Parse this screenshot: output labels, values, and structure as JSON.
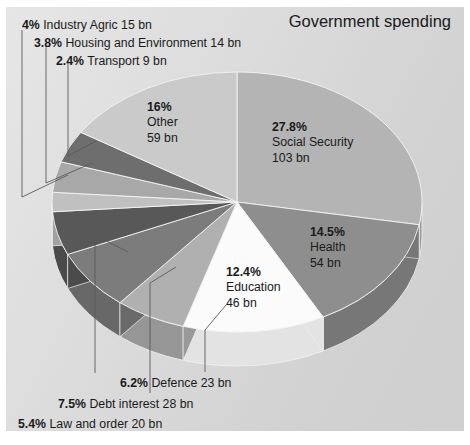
{
  "title": "Government spending",
  "chart_data": {
    "type": "pie",
    "title": "Government spending",
    "units": "bn",
    "legend": "none",
    "three_d": true,
    "slices": [
      {
        "name": "Social Security",
        "percent": 27.8,
        "value": 103,
        "percent_label": "27.8%",
        "value_label": "103 bn",
        "color": "#b4b4b4",
        "side_color": "#9a9a9a",
        "label_placement": "inside"
      },
      {
        "name": "Health",
        "percent": 14.5,
        "value": 54,
        "percent_label": "14.5%",
        "value_label": "54 bn",
        "color": "#8e8e8e",
        "side_color": "#777777",
        "label_placement": "inside"
      },
      {
        "name": "Education",
        "percent": 12.4,
        "value": 46,
        "percent_label": "12.4%",
        "value_label": "46 bn",
        "color": "#fbfbfb",
        "side_color": "#e3e3e3",
        "label_placement": "inside"
      },
      {
        "name": "Defence",
        "percent": 6.2,
        "value": 23,
        "percent_label": "6.2%",
        "value_label": "23 bn",
        "color": "#b0b0b0",
        "side_color": "#969696",
        "label_placement": "callout-bottom"
      },
      {
        "name": "Debt interest",
        "percent": 7.5,
        "value": 28,
        "percent_label": "7.5%",
        "value_label": "28 bn",
        "color": "#7c7c7c",
        "side_color": "#686868",
        "label_placement": "callout-bottom"
      },
      {
        "name": "Law and order",
        "percent": 5.4,
        "value": 20,
        "percent_label": "5.4%",
        "value_label": "20 bn",
        "color": "#585858",
        "side_color": "#4a4a4a",
        "label_placement": "callout-bottom"
      },
      {
        "name": "Transport",
        "percent": 2.4,
        "value": 9,
        "percent_label": "2.4%",
        "value_label": "9 bn",
        "color": "#c0c0c0",
        "side_color": "#a6a6a6",
        "label_placement": "callout-top"
      },
      {
        "name": "Housing and Environment",
        "percent": 3.8,
        "value": 14,
        "percent_label": "3.8%",
        "value_label": "14 bn",
        "color": "#a8a8a8",
        "side_color": "#8e8e8e",
        "label_placement": "callout-top"
      },
      {
        "name": "Industry Agric",
        "percent": 4.0,
        "value": 15,
        "percent_label": "4%",
        "value_label": "15 bn",
        "color": "#6e6e6e",
        "side_color": "#5c5c5c",
        "label_placement": "callout-top"
      },
      {
        "name": "Other",
        "percent": 16.0,
        "value": 59,
        "percent_label": "16%",
        "value_label": "59 bn",
        "color": "#cacaca",
        "side_color": "#b0b0b0",
        "label_placement": "inside"
      }
    ]
  },
  "callouts": {
    "industry_agric": "4% Industry Agric 15 bn",
    "housing": "3.8% Housing and Environment 14 bn",
    "transport": "2.4% Transport 9 bn",
    "defence": "6.2% Defence 23 bn",
    "debt_interest": "7.5% Debt interest 28 bn",
    "law_and_order": "5.4% Law and order 20 bn"
  },
  "inside_labels": {
    "social_security": {
      "pct": "27.8%",
      "name": "Social Security",
      "val": "103 bn"
    },
    "health": {
      "pct": "14.5%",
      "name": "Health",
      "val": "54 bn"
    },
    "education": {
      "pct": "12.4%",
      "name": "Education",
      "val": "46 bn"
    },
    "other": {
      "pct": "16%",
      "name": "Other",
      "val": "59 bn"
    }
  }
}
